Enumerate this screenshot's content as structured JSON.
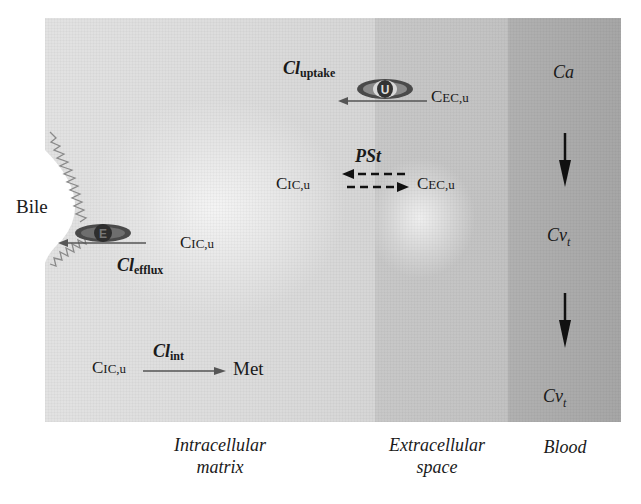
{
  "diagram": {
    "regions": [
      {
        "id": "intracellular",
        "label_line1": "Intracellular",
        "label_line2": "matrix"
      },
      {
        "id": "extracellular",
        "label_line1": "Extracellular",
        "label_line2": "space"
      },
      {
        "id": "blood",
        "label_line1": "Blood",
        "label_line2": ""
      }
    ],
    "bile_label": "Bile",
    "transporters": {
      "uptake": {
        "symbol": "U",
        "clearance_main": "Cl",
        "clearance_sub": "uptake",
        "source_main": "C",
        "source_sub": "EC,u"
      },
      "efflux": {
        "symbol": "E",
        "clearance_main": "Cl",
        "clearance_sub": "efflux",
        "source_main": "C",
        "source_sub": "IC,u"
      }
    },
    "diffusion": {
      "label": "PSt",
      "left_main": "C",
      "left_sub": "IC,u",
      "right_main": "C",
      "right_sub": "EC,u"
    },
    "metabolism": {
      "substrate_main": "C",
      "substrate_sub": "IC,u",
      "clearance_main": "Cl",
      "clearance_sub": "int",
      "product": "Met"
    },
    "blood_flow": {
      "top_main": "Ca",
      "middle_main": "Cv",
      "middle_sub": "t",
      "bottom_main": "Cv",
      "bottom_sub": "t"
    },
    "colors": {
      "intracellular_bg": "#dedede",
      "extracellular_bg": "#c5c5c5",
      "blood_bg": "#acacac",
      "arrow": "#555555",
      "wavy_membrane": "#8a8a8a",
      "transporter": "#4a4a4a"
    }
  }
}
